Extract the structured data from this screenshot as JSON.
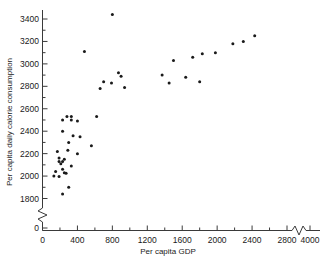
{
  "chart_data": {
    "type": "scatter",
    "title": "",
    "xlabel": "Per capita GDP",
    "ylabel": "Per capita daily calorie consumption",
    "xlim": [
      0,
      4000
    ],
    "ylim": [
      1700,
      3500
    ],
    "grid": false,
    "legend": "none",
    "axis_break_x": "between 2800 and 4000",
    "axis_break_y": "between 0 and 1800",
    "xticks": [
      0,
      400,
      800,
      1200,
      1600,
      2000,
      2400,
      2800,
      4000
    ],
    "yticks": [
      0,
      1800,
      2000,
      2200,
      2400,
      2600,
      2800,
      3000,
      3200,
      3400
    ],
    "xtick_labels": [
      "0",
      "400",
      "800",
      "1200",
      "1600",
      "2000",
      "2400",
      "2800",
      "4000"
    ],
    "ytick_labels": [
      "0",
      "1800",
      "2000",
      "2200",
      "2400",
      "2600",
      "2800",
      "3000",
      "3200",
      "3400"
    ],
    "labeled_points": [
      {
        "label": "Ireland",
        "x": 800,
        "y": 3440,
        "lx": 8,
        "ly": 3
      },
      {
        "label": "New Zealand",
        "x": 1660,
        "y": 3310,
        "lx": 8,
        "ly": 3
      },
      {
        "label": "United States",
        "x": 3000,
        "y": 3220,
        "lx": 1,
        "ly": -34
      },
      {
        "label": "Canada",
        "x": 2580,
        "y": 3270,
        "lx": 8,
        "ly": 3
      },
      {
        "label": "United Kingdom",
        "x": 1450,
        "y": 3180,
        "lx": 1,
        "ly": -10
      },
      {
        "label": "Netherlands",
        "x": 1610,
        "y": 3100,
        "lx": -60,
        "ly": 3
      },
      {
        "label": "Uruguay",
        "x": 700,
        "y": 3060,
        "lx": 8,
        "ly": 3
      },
      {
        "label": "France",
        "x": 1880,
        "y": 3030,
        "lx": -13,
        "ly": 16
      },
      {
        "label": "Sweden",
        "x": 2750,
        "y": 2900,
        "lx": 8,
        "ly": 3
      },
      {
        "label": "Italy",
        "x": 1280,
        "y": 2900,
        "lx": -28,
        "ly": 2
      },
      {
        "label": "West Germany",
        "x": 1700,
        "y": 2950,
        "lx": -22,
        "ly": 17
      },
      {
        "label": "Costa Rica",
        "x": 560,
        "y": 2610,
        "lx": 8,
        "ly": 3
      },
      {
        "label": "Venezuela",
        "x": 980,
        "y": 2430,
        "lx": -58,
        "ly": 2
      },
      {
        "label": "Japan",
        "x": 1270,
        "y": 2480,
        "lx": 8,
        "ly": 3
      },
      {
        "label": "Philippines",
        "x": 290,
        "y": 2020,
        "lx": 8,
        "ly": 3
      },
      {
        "label": "El Salvador",
        "x": 290,
        "y": 1840,
        "lx": 8,
        "ly": 3
      }
    ],
    "unlabeled_points": [
      {
        "x": 480,
        "y": 3110
      },
      {
        "x": 870,
        "y": 2920
      },
      {
        "x": 900,
        "y": 2890
      },
      {
        "x": 700,
        "y": 2840
      },
      {
        "x": 790,
        "y": 2830
      },
      {
        "x": 940,
        "y": 2790
      },
      {
        "x": 660,
        "y": 2780
      },
      {
        "x": 1370,
        "y": 2900
      },
      {
        "x": 1640,
        "y": 2880
      },
      {
        "x": 1500,
        "y": 3030
      },
      {
        "x": 1720,
        "y": 3060
      },
      {
        "x": 1830,
        "y": 3090
      },
      {
        "x": 1980,
        "y": 3100
      },
      {
        "x": 2180,
        "y": 3180
      },
      {
        "x": 2300,
        "y": 3200
      },
      {
        "x": 2430,
        "y": 3250
      },
      {
        "x": 1800,
        "y": 2840
      },
      {
        "x": 1450,
        "y": 2830
      },
      {
        "x": 620,
        "y": 2530
      },
      {
        "x": 280,
        "y": 2530
      },
      {
        "x": 330,
        "y": 2530
      },
      {
        "x": 230,
        "y": 2500
      },
      {
        "x": 330,
        "y": 2500
      },
      {
        "x": 400,
        "y": 2490
      },
      {
        "x": 230,
        "y": 2400
      },
      {
        "x": 350,
        "y": 2360
      },
      {
        "x": 430,
        "y": 2350
      },
      {
        "x": 300,
        "y": 2300
      },
      {
        "x": 560,
        "y": 2270
      },
      {
        "x": 170,
        "y": 2220
      },
      {
        "x": 290,
        "y": 2230
      },
      {
        "x": 400,
        "y": 2200
      },
      {
        "x": 190,
        "y": 2160
      },
      {
        "x": 250,
        "y": 2150
      },
      {
        "x": 190,
        "y": 2130
      },
      {
        "x": 230,
        "y": 2130
      },
      {
        "x": 210,
        "y": 2110
      },
      {
        "x": 330,
        "y": 2090
      },
      {
        "x": 230,
        "y": 2060
      },
      {
        "x": 150,
        "y": 2040
      },
      {
        "x": 250,
        "y": 2030
      },
      {
        "x": 270,
        "y": 2025
      },
      {
        "x": 130,
        "y": 2000
      },
      {
        "x": 190,
        "y": 1995
      },
      {
        "x": 300,
        "y": 1900
      },
      {
        "x": 230,
        "y": 1840
      }
    ]
  },
  "axes": {
    "x_title": "Per capita GDP",
    "y_title": "Per capita daily calorie consumption"
  }
}
